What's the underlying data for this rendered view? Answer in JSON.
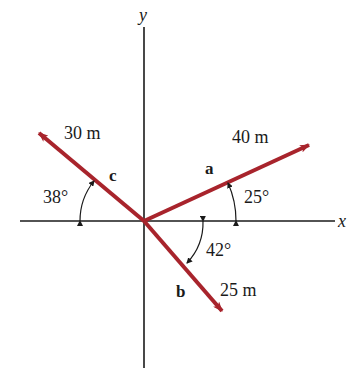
{
  "diagram": {
    "type": "vector-diagram",
    "axes": {
      "x_label": "x",
      "y_label": "y"
    },
    "vectors": [
      {
        "name": "a",
        "magnitude_label": "40 m",
        "angle_label": "25°",
        "angle_deg": 25,
        "reference": "+x axis, counterclockwise"
      },
      {
        "name": "b",
        "magnitude_label": "25 m",
        "angle_label": "42°",
        "angle_deg": 42,
        "reference": "+x axis, clockwise"
      },
      {
        "name": "c",
        "magnitude_label": "30 m",
        "angle_label": "38°",
        "angle_deg": 38,
        "reference": "-x axis, clockwise"
      }
    ],
    "colors": {
      "vector": "#a8242c",
      "axis": "#1a1a1a",
      "text": "#1a1a1a"
    }
  }
}
